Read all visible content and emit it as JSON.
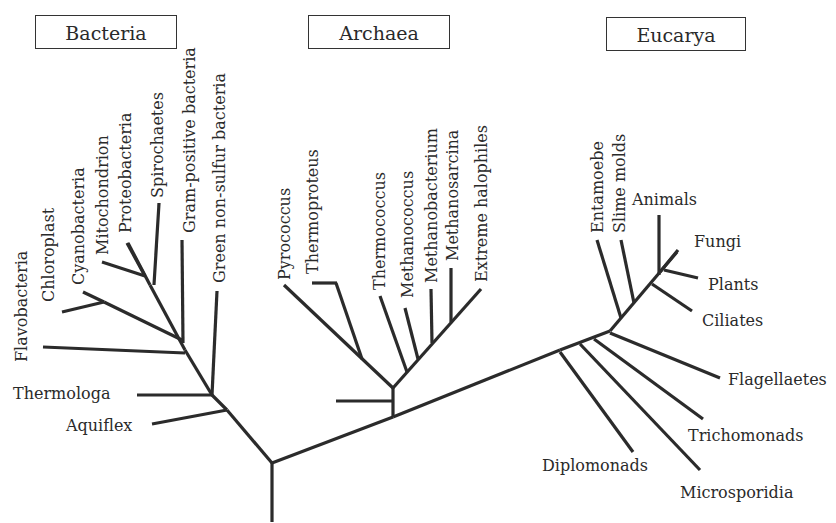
{
  "domains": [
    {
      "name": "Bacteria",
      "x": 35,
      "y": 15,
      "w": 142
    },
    {
      "name": "Archaea",
      "x": 308,
      "y": 15,
      "w": 142
    },
    {
      "name": "Eucarya",
      "x": 606,
      "y": 17,
      "w": 140
    }
  ],
  "colors": {
    "line": "#2b2b2b",
    "text": "#2a2a2a",
    "background": "#ffffff"
  },
  "bacteria_labels": {
    "flavobacteria": "Flavobacteria",
    "chloroplast": "Chloroplast",
    "cyanobacteria": "Cyanobacteria",
    "mitochondrion": "Mitochondrion",
    "proteobacteria": "Proteobacteria",
    "spirochaetes": "Spirochaetes",
    "gram_positive": "Gram-positive bacteria",
    "green_non_sulfur": "Green non-sulfur bacteria",
    "thermologa": "Thermologa",
    "aquiflex": "Aquiflex"
  },
  "archaea_labels": {
    "pyrococcus": "Pyrococcus",
    "thermoproteus": "Thermoproteus",
    "thermococcus": "Thermococcus",
    "methanococcus": "Methanococcus",
    "methanobacterium": "Methanobacterium",
    "methanosarcina": "Methanosarcina",
    "extreme_halophiles": "Extreme halophiles"
  },
  "eucarya_labels": {
    "entamoebe": "Entamoebe",
    "slime_molds": "Slime molds",
    "animals": "Animals",
    "fungi": "Fungi",
    "plants": "Plants",
    "ciliates": "Ciliates",
    "flagellaetes": "Flagellaetes",
    "trichomonads": "Trichomonads",
    "microsporidia": "Microsporidia",
    "diplomonads": "Diplomonads"
  }
}
